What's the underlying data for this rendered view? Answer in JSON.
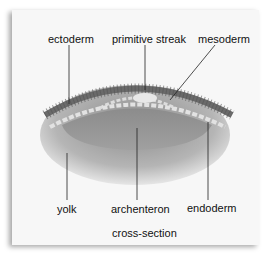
{
  "labels": {
    "ectoderm": "ectoderm",
    "primitive_streak": "primitive streak",
    "mesoderm": "mesoderm",
    "yolk": "yolk",
    "archenteron": "archenteron",
    "endoderm": "endoderm"
  },
  "caption": "cross-section"
}
